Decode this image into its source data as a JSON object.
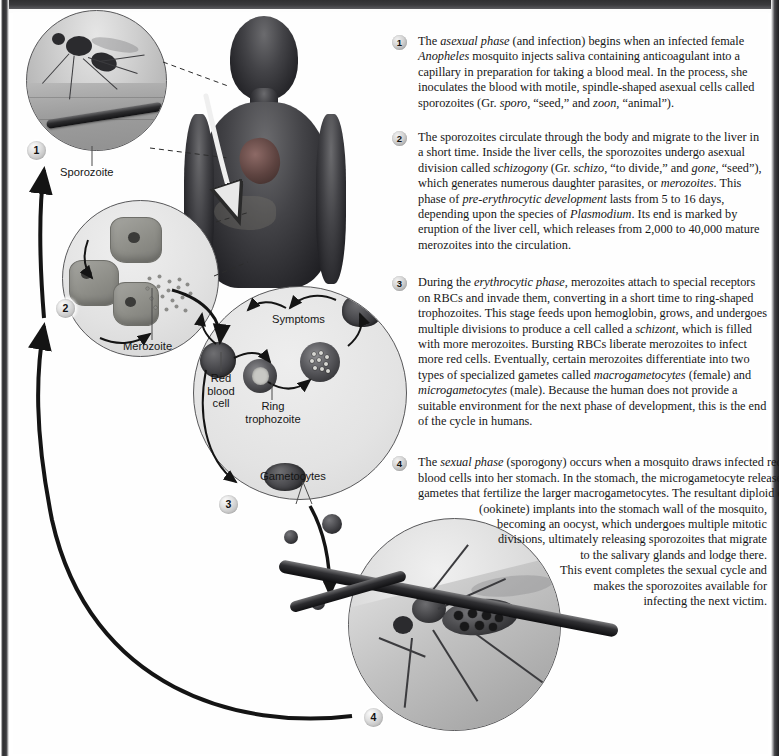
{
  "steps": [
    {
      "number": "1",
      "segments": [
        {
          "t": "The ",
          "style": "normal"
        },
        {
          "t": "asexual phase",
          "style": "italic"
        },
        {
          "t": " (and infection) begins when an infected female ",
          "style": "normal"
        },
        {
          "t": "Anopheles",
          "style": "italic"
        },
        {
          "t": " mosquito injects saliva containing anticoagulant into a capillary in preparation for taking a blood meal. In the process, she inoculates the blood with motile, spindle-shaped asexual cells called sporozoites (Gr. ",
          "style": "normal"
        },
        {
          "t": "sporo",
          "style": "italic"
        },
        {
          "t": ", “seed,” and ",
          "style": "normal"
        },
        {
          "t": "zoon",
          "style": "italic"
        },
        {
          "t": ", “animal”).",
          "style": "normal"
        }
      ]
    },
    {
      "number": "2",
      "segments": [
        {
          "t": "The sporozoites circulate through the body and migrate to the liver in a short time. Inside the liver cells, the sporozoites undergo asexual division called ",
          "style": "normal"
        },
        {
          "t": "schizogony",
          "style": "italic"
        },
        {
          "t": " (Gr. ",
          "style": "normal"
        },
        {
          "t": "schizo",
          "style": "italic"
        },
        {
          "t": ", “to divide,” and ",
          "style": "normal"
        },
        {
          "t": "gone",
          "style": "italic"
        },
        {
          "t": ", “seed”), which generates numerous daughter parasites, or ",
          "style": "normal"
        },
        {
          "t": "merozoites",
          "style": "italic"
        },
        {
          "t": ". This phase of ",
          "style": "normal"
        },
        {
          "t": "pre-erythrocytic development",
          "style": "italic"
        },
        {
          "t": " lasts from 5 to 16 days, depending upon the species of ",
          "style": "normal"
        },
        {
          "t": "Plasmodium",
          "style": "italic"
        },
        {
          "t": ". Its end is marked by eruption of the liver cell, which releases from 2,000 to 40,000 mature merozoites into the circulation.",
          "style": "normal"
        }
      ]
    },
    {
      "number": "3",
      "segments": [
        {
          "t": "During the ",
          "style": "normal"
        },
        {
          "t": "erythrocytic phase",
          "style": "italic"
        },
        {
          "t": ", merozoites attach to special receptors on RBCs and invade them, converting in a short time to ring-shaped trophozoites. This stage feeds upon hemoglobin, grows, and undergoes multiple divisions to produce a cell called a ",
          "style": "normal"
        },
        {
          "t": "schizont",
          "style": "italic"
        },
        {
          "t": ", which is filled with more merozoites. Bursting RBCs liberate merozoites to infect more red cells. Eventually, certain merozoites differentiate into two types of specialized gametes called ",
          "style": "normal"
        },
        {
          "t": "macrogametocytes",
          "style": "italic"
        },
        {
          "t": " (female) and ",
          "style": "normal"
        },
        {
          "t": "microgametocytes",
          "style": "italic"
        },
        {
          "t": " (male). Because the human does not provide a suitable environment for the next phase of development, this is the end of the cycle in humans.",
          "style": "normal"
        }
      ]
    }
  ],
  "step4": {
    "number": "4",
    "lines": [
      {
        "segments": [
          {
            "t": "The ",
            "style": "normal"
          },
          {
            "t": "sexual phase",
            "style": "italic"
          },
          {
            "t": " (sporogony) occurs when a mosquito draws infected red",
            "style": "normal"
          }
        ],
        "align": "left"
      },
      {
        "segments": [
          {
            "t": "blood cells into her stomach. In the stomach, the microgametocyte releases",
            "style": "normal"
          }
        ],
        "align": "left"
      },
      {
        "segments": [
          {
            "t": "gametes that fertilize the larger macrogametocytes. The resultant diploid cell",
            "style": "normal"
          }
        ],
        "align": "right"
      },
      {
        "segments": [
          {
            "t": "(ookinete) implants into the stomach wall of the mosquito,",
            "style": "normal"
          }
        ],
        "align": "right"
      },
      {
        "segments": [
          {
            "t": "becoming an oocyst, which undergoes multiple mitotic",
            "style": "normal"
          }
        ],
        "align": "right"
      },
      {
        "segments": [
          {
            "t": "divisions, ultimately releasing sporozoites that migrate",
            "style": "normal"
          }
        ],
        "align": "right"
      },
      {
        "segments": [
          {
            "t": "to the salivary glands and lodge there.",
            "style": "normal"
          }
        ],
        "align": "right"
      },
      {
        "segments": [
          {
            "t": "This event completes the sexual cycle and",
            "style": "normal"
          }
        ],
        "align": "right"
      },
      {
        "segments": [
          {
            "t": "makes the sporozoites available for",
            "style": "normal"
          }
        ],
        "align": "right"
      },
      {
        "segments": [
          {
            "t": "infecting the next victim.",
            "style": "normal"
          }
        ],
        "align": "right"
      }
    ]
  },
  "diagram": {
    "labels": {
      "sporozoite": "Sporozoite",
      "merozoite": "Merozoite",
      "symptoms": "Symptoms",
      "red_blood_cell": "Red\nblood\ncell",
      "red_blood_cell_lines": [
        "Red",
        "blood",
        "cell"
      ],
      "ring_trophozoite_lines": [
        "Ring",
        "trophozoite"
      ],
      "gametocytes": "Gametocytes"
    },
    "badges": [
      "1",
      "2",
      "3",
      "4"
    ]
  },
  "colors": {
    "page_background": "#ffffff",
    "text": "#161616",
    "edge_bar": "#2e2e30",
    "badge_fill": "#e0e0e0",
    "circle_stroke": "#58585a",
    "arrow": "#1a1a1a"
  }
}
